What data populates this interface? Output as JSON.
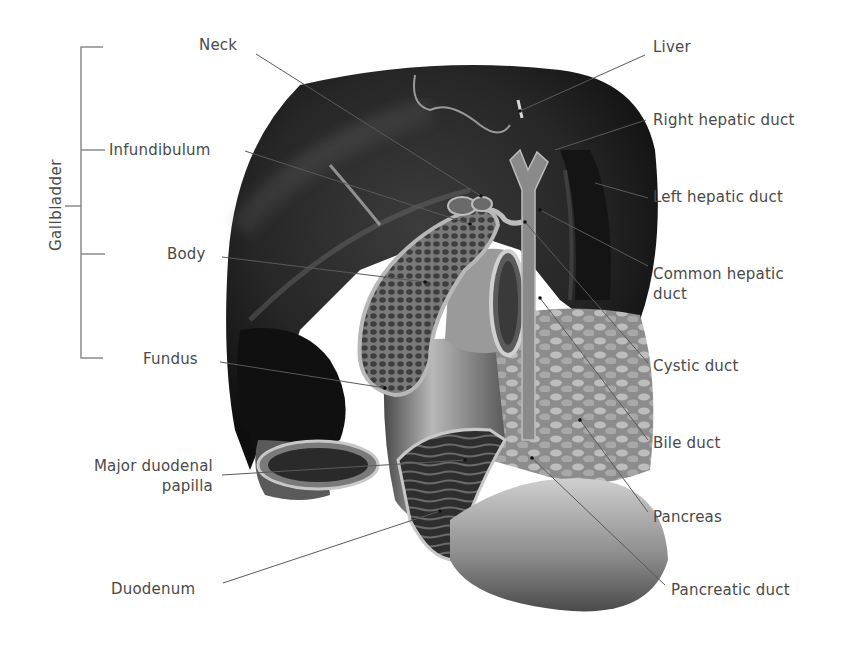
{
  "figure": {
    "type": "anatomical-illustration",
    "colors": {
      "background": "#ffffff",
      "label_text": "#4a4a4a",
      "leader_line": "#5a5a5a",
      "bracket_line": "#8a8a8a"
    },
    "bracket": {
      "label": "Gallbladder",
      "members": [
        "Neck",
        "Infundibulum",
        "Body",
        "Fundus"
      ]
    },
    "labels_left": [
      {
        "id": "neck",
        "text": "Neck"
      },
      {
        "id": "infundibulum",
        "text": "Infundibulum"
      },
      {
        "id": "body",
        "text": "Body"
      },
      {
        "id": "fundus",
        "text": "Fundus"
      },
      {
        "id": "major-duodenal-papilla",
        "line1": "Major duodenal",
        "line2": "papilla"
      },
      {
        "id": "duodenum",
        "text": "Duodenum"
      }
    ],
    "labels_right": [
      {
        "id": "liver",
        "text": "Liver"
      },
      {
        "id": "right-hepatic-duct",
        "text": "Right hepatic duct"
      },
      {
        "id": "left-hepatic-duct",
        "text": "Left hepatic duct"
      },
      {
        "id": "common-hepatic-duct",
        "line1": "Common hepatic",
        "line2": "duct"
      },
      {
        "id": "cystic-duct",
        "text": "Cystic duct"
      },
      {
        "id": "bile-duct",
        "text": "Bile duct"
      },
      {
        "id": "pancreas",
        "text": "Pancreas"
      },
      {
        "id": "pancreatic-duct",
        "text": "Pancreatic duct"
      }
    ]
  }
}
